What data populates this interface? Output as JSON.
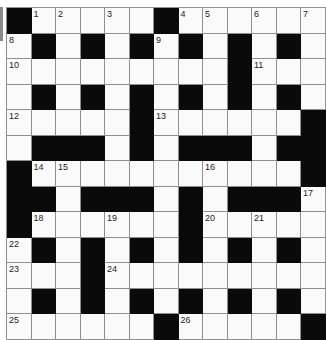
{
  "puzzle": {
    "rows": 13,
    "cols": 13,
    "grid": [
      "#WWWWW#WWWWWW",
      "W#W#W#W#W#W#W",
      "WWWWWWWWW#WWW",
      "W#W#W#W#W#W#W",
      "WWWWW#WWWWWW#",
      "W###W#W###W##",
      "#WWWWWWWWWWW#",
      "##W###W#W###W",
      "#WWWWWW#WWWWW",
      "W#W#W#W#W#W#W",
      "WWW#WWWWWWWWW",
      "W#W#W#W#W#W#W",
      "WWWWWW#WWWWW#"
    ],
    "numbers": [
      {
        "r": 0,
        "c": 1,
        "n": "1"
      },
      {
        "r": 0,
        "c": 2,
        "n": "2"
      },
      {
        "r": 0,
        "c": 4,
        "n": "3"
      },
      {
        "r": 0,
        "c": 7,
        "n": "4"
      },
      {
        "r": 0,
        "c": 8,
        "n": "5"
      },
      {
        "r": 0,
        "c": 10,
        "n": "6"
      },
      {
        "r": 0,
        "c": 12,
        "n": "7"
      },
      {
        "r": 1,
        "c": 0,
        "n": "8"
      },
      {
        "r": 1,
        "c": 6,
        "n": "9"
      },
      {
        "r": 2,
        "c": 0,
        "n": "10"
      },
      {
        "r": 2,
        "c": 10,
        "n": "11"
      },
      {
        "r": 4,
        "c": 0,
        "n": "12"
      },
      {
        "r": 4,
        "c": 6,
        "n": "13"
      },
      {
        "r": 6,
        "c": 1,
        "n": "14"
      },
      {
        "r": 6,
        "c": 2,
        "n": "15"
      },
      {
        "r": 6,
        "c": 8,
        "n": "16"
      },
      {
        "r": 7,
        "c": 12,
        "n": "17"
      },
      {
        "r": 8,
        "c": 1,
        "n": "18"
      },
      {
        "r": 8,
        "c": 4,
        "n": "19"
      },
      {
        "r": 8,
        "c": 8,
        "n": "20"
      },
      {
        "r": 8,
        "c": 10,
        "n": "21"
      },
      {
        "r": 9,
        "c": 0,
        "n": "22"
      },
      {
        "r": 10,
        "c": 0,
        "n": "23"
      },
      {
        "r": 10,
        "c": 4,
        "n": "24"
      },
      {
        "r": 12,
        "c": 0,
        "n": "25"
      },
      {
        "r": 12,
        "c": 7,
        "n": "26"
      }
    ],
    "colors": {
      "black": "#0a0a0a",
      "white": "#fafafa",
      "line": "#8f8f8f"
    }
  }
}
